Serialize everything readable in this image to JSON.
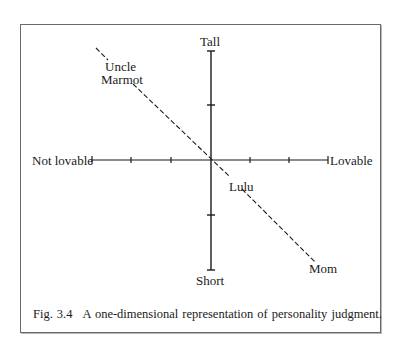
{
  "figure": {
    "caption_prefix": "Fig.",
    "caption_number": "3.4",
    "caption_text": "A one-dimensional representation of personality judgment."
  },
  "axes": {
    "horizontal": {
      "negative_label": "Not lovable",
      "positive_label": "Lovable",
      "ticks_per_side": 2
    },
    "vertical": {
      "positive_label": "Tall",
      "negative_label": "Short",
      "ticks_per_side": 1
    }
  },
  "points": [
    {
      "label_line1": "Uncle",
      "label_line2": "Marmot"
    },
    {
      "label_line1": "Lulu"
    },
    {
      "label_line1": "Mom"
    }
  ],
  "colors": {
    "ink": "#1a1a1a",
    "frame": "#6a6a6a",
    "background": "#ffffff"
  }
}
